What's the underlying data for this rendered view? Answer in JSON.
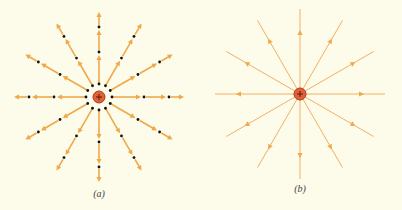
{
  "colors": {
    "background": "#fdfbea",
    "field_line": "#f0a94a",
    "field_line_thin": "#f2b064",
    "dot": "#111111",
    "charge_fill": "#e0603a",
    "charge_stroke": "#b03a1e",
    "charge_sign": "#5a1a0a"
  },
  "panels": [
    {
      "id": "a",
      "caption": "(a)",
      "style": "vectors",
      "center": [
        99,
        97
      ],
      "charge_sign": "+",
      "charge_radius": 6,
      "num_lines": 12,
      "start_angle_deg": 0,
      "line_length": 85,
      "inner_dot_radius": 13,
      "vector_dots": [
        45,
        70
      ],
      "vector_segments": [
        [
          14,
          42
        ],
        [
          47,
          67
        ],
        [
          72,
          85
        ]
      ]
    },
    {
      "id": "b",
      "caption": "(b)",
      "style": "field_lines",
      "center": [
        300,
        94
      ],
      "charge_sign": "+",
      "charge_radius": 6,
      "num_lines": 12,
      "start_angle_deg": 0,
      "line_length": 85,
      "arrow_position": 64
    }
  ]
}
